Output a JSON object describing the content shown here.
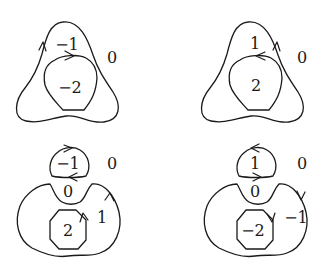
{
  "diagram": {
    "panels": [
      {
        "id": "top-left",
        "labels": {
          "outer_region": "−1",
          "inner_region": "−2",
          "exterior": "0"
        },
        "outer_arrow_direction": "up (left side)",
        "inner_arrow_direction": "right (top)"
      },
      {
        "id": "top-right",
        "labels": {
          "outer_region": "1",
          "inner_region": "2",
          "exterior": "0"
        },
        "outer_arrow_direction": "up (right side)",
        "inner_arrow_direction": "left (top)"
      },
      {
        "id": "bottom-left",
        "labels": {
          "cap_region": "−1",
          "notch_region": "0",
          "outer_region": "1",
          "inner_region": "2",
          "exterior": "0"
        },
        "cap_arrows": [
          "right (top)",
          "left (bottom)"
        ],
        "outer_arrow_direction": "up (right side)",
        "inner_arrow_direction": "up (right side)"
      },
      {
        "id": "bottom-right",
        "labels": {
          "cap_region": "1",
          "notch_region": "0",
          "outer_region": "−1",
          "inner_region": "−2",
          "exterior": "0"
        },
        "cap_arrows": [
          "left (top)",
          "right (bottom)"
        ],
        "outer_arrow_direction": "down (right side)",
        "inner_arrow_direction": "down (right side)"
      }
    ],
    "stroke_color": "#1a1a1a",
    "background": "#ffffff"
  }
}
